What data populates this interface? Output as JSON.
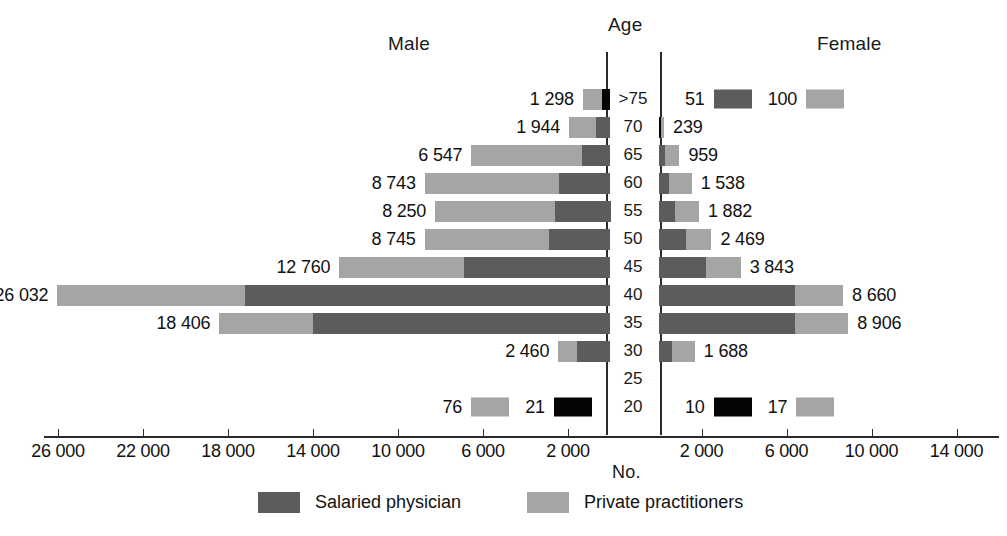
{
  "header": {
    "male": "Male",
    "female": "Female",
    "age": "Age",
    "no": "No."
  },
  "legend": {
    "items": [
      {
        "label": "Salaried physician",
        "color": "#5c5c5c",
        "key": "salaried"
      },
      {
        "label": "Private practitioners",
        "color": "#a5a5a5",
        "key": "private"
      }
    ]
  },
  "axis": {
    "left_ticks": [
      "26 000",
      "22 000",
      "18 000",
      "14 000",
      "10 000",
      "6 000",
      "2 000"
    ],
    "right_ticks": [
      "2 000",
      "6 000",
      "10 000",
      "14 000"
    ],
    "age_labels": [
      ">75",
      "70",
      "65",
      "60",
      "55",
      "50",
      "45",
      "40",
      "35",
      "30",
      "25",
      "20"
    ]
  },
  "chart_data": {
    "type": "bar",
    "subtype": "population-pyramid",
    "title": "",
    "xlabel": "No.",
    "ylabel": "Age",
    "grid": false,
    "legend_position": "bottom",
    "categories": [
      ">75",
      "70",
      "65",
      "60",
      "55",
      "50",
      "45",
      "40",
      "35",
      "30",
      "25",
      "20"
    ],
    "left_axis_ticks": [
      26000,
      22000,
      18000,
      14000,
      10000,
      6000,
      2000
    ],
    "right_axis_ticks": [
      2000,
      6000,
      10000,
      14000
    ],
    "colors": {
      "salaried": "#5c5c5c",
      "private": "#a5a5a5",
      "black": "#050505"
    },
    "series": [
      {
        "name": "Male",
        "side": "left",
        "rows": [
          {
            "age": ">75",
            "total_label": "1 298",
            "total": 1298,
            "salaried": 420,
            "private": 878,
            "special_black": true
          },
          {
            "age": "70",
            "total_label": "1 944",
            "total": 1944,
            "salaried": 700,
            "private": 1244
          },
          {
            "age": "65",
            "total_label": "6 547",
            "total": 6547,
            "salaried": 1330,
            "private": 5217
          },
          {
            "age": "60",
            "total_label": "8 743",
            "total": 8743,
            "salaried": 2400,
            "private": 6343
          },
          {
            "age": "55",
            "total_label": "8 250",
            "total": 8250,
            "salaried": 2600,
            "private": 5650
          },
          {
            "age": "50",
            "total_label": "8 745",
            "total": 8745,
            "salaried": 2900,
            "private": 5845
          },
          {
            "age": "45",
            "total_label": "12 760",
            "total": 12760,
            "salaried": 6900,
            "private": 5860
          },
          {
            "age": "40",
            "total_label": "26 032",
            "total": 26032,
            "salaried": 17200,
            "private": 8832
          },
          {
            "age": "35",
            "total_label": "18 406",
            "total": 18406,
            "salaried": 14000,
            "private": 4406
          },
          {
            "age": "30",
            "total_label": "2 460",
            "total": 2460,
            "salaried": 1560,
            "private": 900
          },
          {
            "age": "25",
            "total_label": "",
            "total": 0,
            "salaried": 0,
            "private": 0
          },
          {
            "age": "20",
            "total_label": "",
            "total": 97,
            "inline": [
              {
                "value": "76",
                "swatch": "private"
              },
              {
                "value": "21",
                "swatch": "black"
              }
            ]
          }
        ]
      },
      {
        "name": "Female",
        "side": "right",
        "rows": [
          {
            "age": ">75",
            "total_label": "",
            "total": 151,
            "inline": [
              {
                "value": "51",
                "swatch": "salaried"
              },
              {
                "value": "100",
                "swatch": "private"
              }
            ]
          },
          {
            "age": "70",
            "total_label": "239",
            "total": 239,
            "salaried": 90,
            "private": 149,
            "special_black": true
          },
          {
            "age": "65",
            "total_label": "959",
            "total": 959,
            "salaried": 300,
            "private": 659
          },
          {
            "age": "60",
            "total_label": "1 538",
            "total": 1538,
            "salaried": 460,
            "private": 1078
          },
          {
            "age": "55",
            "total_label": "1 882",
            "total": 1882,
            "salaried": 740,
            "private": 1142
          },
          {
            "age": "50",
            "total_label": "2 469",
            "total": 2469,
            "salaried": 1250,
            "private": 1219
          },
          {
            "age": "45",
            "total_label": "3 843",
            "total": 3843,
            "salaried": 2200,
            "private": 1643
          },
          {
            "age": "40",
            "total_label": "8 660",
            "total": 8660,
            "salaried": 6400,
            "private": 2260
          },
          {
            "age": "35",
            "total_label": "8 906",
            "total": 8906,
            "salaried": 6400,
            "private": 2506
          },
          {
            "age": "30",
            "total_label": "1 688",
            "total": 1688,
            "salaried": 620,
            "private": 1068
          },
          {
            "age": "25",
            "total_label": "",
            "total": 0,
            "salaried": 0,
            "private": 0
          },
          {
            "age": "20",
            "total_label": "",
            "total": 27,
            "inline": [
              {
                "value": "10",
                "swatch": "black"
              },
              {
                "value": "17",
                "swatch": "private"
              }
            ]
          }
        ]
      }
    ]
  }
}
